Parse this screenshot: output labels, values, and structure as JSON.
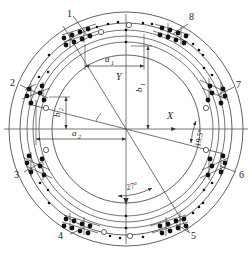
{
  "figure": {
    "type": "engineering-drawing",
    "background": "#ffffff",
    "line_color": "#3a3a3a",
    "axis_color": "#555555",
    "marker_color": "#111111"
  },
  "axes": {
    "x_label": "X",
    "y_label": "Y",
    "origin_label": ""
  },
  "dimensions": [
    {
      "id": "a1",
      "label": "a",
      "subscript": "1"
    },
    {
      "id": "a2",
      "label": "a",
      "subscript": "2"
    },
    {
      "id": "b1",
      "label": "b",
      "subscript": "1"
    },
    {
      "id": "b2",
      "label": "b",
      "subscript": "2"
    }
  ],
  "angles": [
    {
      "id": "angle-19-5",
      "value": "19.5",
      "unit": "°",
      "text": "19.5°"
    },
    {
      "id": "angle-27",
      "value": "27",
      "unit": "°",
      "text": "27°"
    }
  ],
  "callouts": [
    {
      "n": "1",
      "x": 67,
      "y": 17
    },
    {
      "n": "2",
      "x": 13,
      "y": 83
    },
    {
      "n": "3",
      "x": 16,
      "y": 175
    },
    {
      "n": "4",
      "x": 60,
      "y": 236
    },
    {
      "n": "5",
      "x": 192,
      "y": 236
    },
    {
      "n": "6",
      "x": 240,
      "y": 175
    },
    {
      "n": "7",
      "x": 238,
      "y": 85
    },
    {
      "n": "8",
      "x": 191,
      "y": 20
    }
  ],
  "circles": {
    "radii": [
      117,
      106,
      96,
      88,
      84,
      74
    ],
    "center": {
      "cx": 126,
      "cy": 129
    }
  },
  "bolt_groups": {
    "count": 8,
    "angles_deg": [
      63,
      117,
      153,
      207,
      243,
      297,
      333,
      27
    ],
    "markers_per_group": 10
  }
}
